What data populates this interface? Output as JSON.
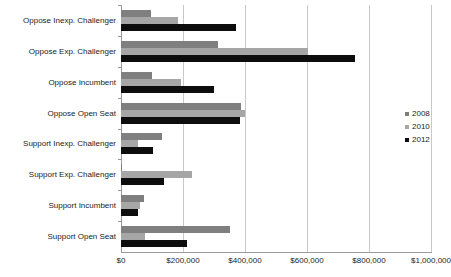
{
  "chart_data": {
    "type": "bar",
    "orientation": "horizontal",
    "title": "",
    "xlabel": "",
    "ylabel": "",
    "xlim": [
      0,
      1000000
    ],
    "grid": true,
    "legend_position": "right",
    "tick_labels": [
      "$0",
      "$200,000",
      "$400,000",
      "$600,000",
      "$800,000",
      "$1,000,000"
    ],
    "ticks": [
      0,
      200000,
      400000,
      600000,
      800000,
      1000000
    ],
    "categories": [
      "Oppose Inexp. Challenger",
      "Oppose Exp. Challenger",
      "Oppose Incumbent",
      "Oppose Open Seat",
      "Support Inexp. Challenger",
      "Support Exp. Challenger",
      "Support Incumbent",
      "Support Open Seat"
    ],
    "series": [
      {
        "name": "2008",
        "color": "#7f7f7f",
        "values": [
          97000,
          313000,
          100000,
          387000,
          132000,
          4000,
          74000,
          352000
        ]
      },
      {
        "name": "2010",
        "color": "#a6a6a6",
        "values": [
          184000,
          603000,
          194000,
          400000,
          55000,
          229000,
          61000,
          77000
        ]
      },
      {
        "name": "2012",
        "color": "#0d0d0d",
        "values": [
          371000,
          755000,
          300000,
          384000,
          103000,
          139000,
          55000,
          213000
        ]
      }
    ]
  }
}
